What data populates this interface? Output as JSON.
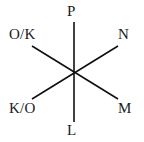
{
  "diagram": {
    "type": "six-ray-axis-star",
    "center": {
      "x": 74,
      "y": 72
    },
    "stroke_color": "#111111",
    "background_color": "#ffffff",
    "text_color": "#1a1a1a",
    "lines": [
      {
        "name": "vertical-axis",
        "x1": 74,
        "y1": 22,
        "x2": 74,
        "y2": 122
      },
      {
        "name": "diagonal-nw-se-axis",
        "x1": 32,
        "y1": 46,
        "x2": 118,
        "y2": 99
      },
      {
        "name": "diagonal-sw-ne-axis",
        "x1": 32,
        "y1": 99,
        "x2": 118,
        "y2": 46
      }
    ],
    "labels": {
      "top": "P",
      "upper_right": "N",
      "lower_right": "M",
      "bottom": "L",
      "lower_left": "K/O",
      "upper_left": "O/K"
    }
  }
}
